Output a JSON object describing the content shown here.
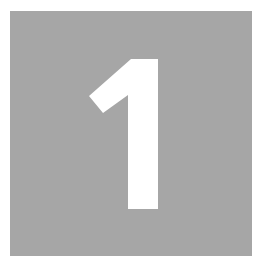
{
  "tile": {
    "digit": "1",
    "background_color": "#a6a6a6",
    "digit_color": "#ffffff"
  }
}
